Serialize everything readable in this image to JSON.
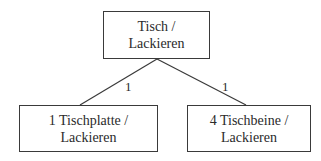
{
  "diagram": {
    "root": {
      "line1": "Tisch /",
      "line2": "Lackieren"
    },
    "children": [
      {
        "line1": "1 Tischplatte /",
        "line2": "Lackieren",
        "edge_label": "1"
      },
      {
        "line1": "4 Tischbeine /",
        "line2": "Lackieren",
        "edge_label": "1"
      }
    ]
  }
}
